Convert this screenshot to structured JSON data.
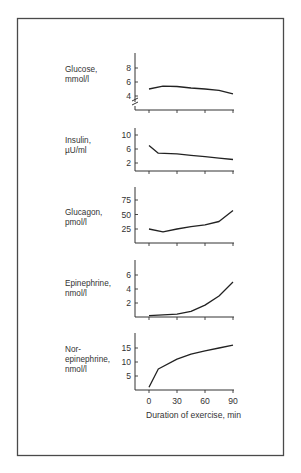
{
  "chart_data": {
    "type": "line",
    "title": "",
    "xlabel": "Duration of exercise, min",
    "x_ticks": [
      0,
      30,
      60,
      90
    ],
    "xlim": [
      0,
      90
    ],
    "grid": false,
    "legend": "none",
    "panels": [
      {
        "name": "glucose",
        "label_lines": [
          "Glucose,",
          "mmol/l"
        ],
        "ylabel": "Glucose, mmol/l",
        "y_ticks": [
          4,
          6,
          8
        ],
        "axis_break": true,
        "x": [
          0,
          15,
          30,
          45,
          60,
          75,
          90
        ],
        "values": [
          5.0,
          5.4,
          5.35,
          5.15,
          5.0,
          4.8,
          4.3
        ]
      },
      {
        "name": "insulin",
        "label_lines": [
          "Insulin,",
          "µU/ml"
        ],
        "ylabel": "Insulin, µU/ml",
        "y_ticks": [
          2,
          6,
          10
        ],
        "axis_break": false,
        "x": [
          0,
          10,
          30,
          45,
          60,
          75,
          90
        ],
        "values": [
          7.0,
          4.8,
          4.6,
          4.2,
          3.8,
          3.4,
          3.0
        ]
      },
      {
        "name": "glucagon",
        "label_lines": [
          "Glucagon,",
          "pmol/l"
        ],
        "ylabel": "Glucagon, pmol/l",
        "y_ticks": [
          25,
          50,
          75
        ],
        "axis_break": false,
        "x": [
          0,
          15,
          30,
          45,
          60,
          75,
          90
        ],
        "values": [
          25,
          20,
          25,
          29,
          32,
          38,
          57
        ]
      },
      {
        "name": "epinephrine",
        "label_lines": [
          "Epinephrine,",
          "nmol/l"
        ],
        "ylabel": "Epinephrine, nmol/l",
        "y_ticks": [
          2,
          4,
          6
        ],
        "axis_break": false,
        "x": [
          0,
          15,
          30,
          45,
          60,
          75,
          90
        ],
        "values": [
          0.2,
          0.3,
          0.4,
          0.8,
          1.7,
          3.0,
          5.0
        ]
      },
      {
        "name": "norepinephrine",
        "label_lines": [
          "Nor-",
          "epinephrine,",
          "nmol/l"
        ],
        "ylabel": "Norepinephrine, nmol/l",
        "y_ticks": [
          5,
          10,
          15
        ],
        "axis_break": false,
        "x": [
          0,
          10,
          30,
          45,
          60,
          75,
          90
        ],
        "values": [
          1.0,
          7.5,
          11.0,
          12.8,
          14.0,
          15.0,
          16.0
        ]
      }
    ]
  }
}
